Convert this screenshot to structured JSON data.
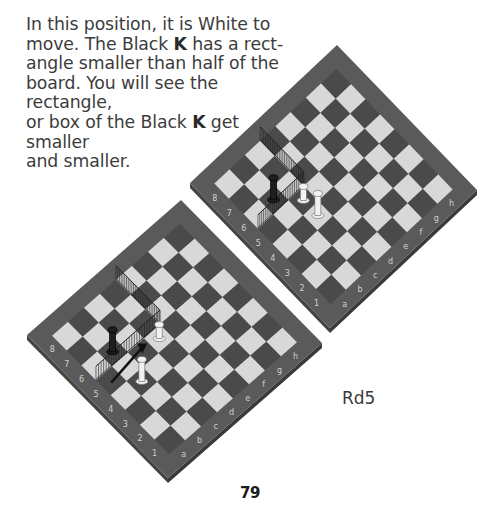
{
  "text": {
    "line1": "In this position, it is White to",
    "line2a": "move.  The Black ",
    "k1": "K",
    "line2b": " has a rect-",
    "line3": "angle smaller than half of the",
    "line4": "board. You will see the rectangle,",
    "line5a": "or box of the Black ",
    "k2": "K",
    "line5b": " get smaller",
    "line6": "and smaller."
  },
  "caption": "Rd5",
  "page_number": "79",
  "diagrams": [
    {
      "name": "before-move",
      "files": [
        "a",
        "b",
        "c",
        "d",
        "e",
        "f",
        "g",
        "h"
      ],
      "ranks": [
        "1",
        "2",
        "3",
        "4",
        "5",
        "6",
        "7",
        "8"
      ],
      "pieces": [
        {
          "piece": "black-king",
          "square": "b6"
        },
        {
          "piece": "white-king",
          "square": "b4"
        },
        {
          "piece": "white-rook",
          "square": "d5"
        }
      ]
    },
    {
      "name": "after-move",
      "move": "Rd5",
      "pieces": [
        {
          "piece": "black-king",
          "square": "b6"
        },
        {
          "piece": "white-rook",
          "square": "c5"
        },
        {
          "piece": "white-king",
          "square": "c4"
        }
      ]
    }
  ],
  "colors": {
    "frame": "#5a5a5a",
    "dark_square": "#4a4a4a",
    "light_square": "#d8d8d8",
    "label": "#d0d0d0"
  }
}
